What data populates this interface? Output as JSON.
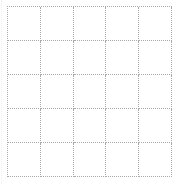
{
  "grid": {
    "rows": 5,
    "columns": 5,
    "line_style": "dotted",
    "line_color": "#aaaaaa",
    "background": "#ffffff"
  }
}
